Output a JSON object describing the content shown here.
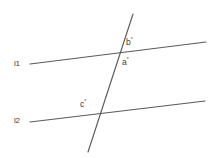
{
  "figure": {
    "background_color": "#ffffff",
    "stroke_color": "#5a5a5a",
    "text_color": "#3d3d3d",
    "width": 214,
    "height": 158
  },
  "lines": {
    "l1": {
      "label": "l1",
      "x1": 30,
      "y1": 64,
      "x2": 206,
      "y2": 42
    },
    "l2": {
      "label": "l2",
      "x1": 30,
      "y1": 122,
      "x2": 205,
      "y2": 101
    },
    "transversal": {
      "label": "",
      "x1": 133,
      "y1": 14,
      "x2": 88,
      "y2": 152
    }
  },
  "intersections": {
    "upper": {
      "x": 118,
      "y": 53
    },
    "lower": {
      "x": 98,
      "y": 116
    }
  },
  "angles": {
    "a": {
      "name": "a",
      "text": "a",
      "degree_symbol": "°"
    },
    "b": {
      "name": "b",
      "text": "b",
      "degree_symbol": "°"
    },
    "c": {
      "name": "c",
      "text": "c",
      "degree_symbol": "°"
    }
  }
}
